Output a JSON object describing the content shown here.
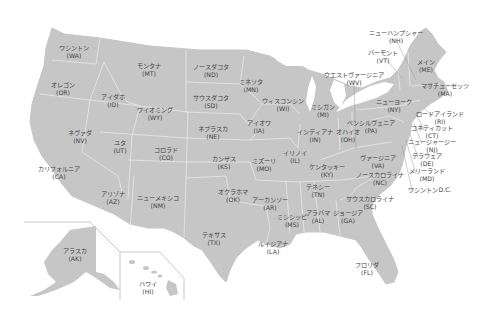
{
  "map": {
    "fill": "#c6c6c6",
    "border": "#ffffff",
    "leader_color": "#9a9a9a",
    "text_color": "#444444",
    "states": [
      {
        "name": "ワシントン",
        "abbr": "(WA)",
        "x": 74,
        "y": 44
      },
      {
        "name": "オレゴン",
        "abbr": "(OR)",
        "x": 63,
        "y": 81
      },
      {
        "name": "カリフォルニア",
        "abbr": "(CA)",
        "x": 59,
        "y": 165
      },
      {
        "name": "ネヴァダ",
        "abbr": "(NV)",
        "x": 80,
        "y": 129
      },
      {
        "name": "アイダホ",
        "abbr": "(ID)",
        "x": 113,
        "y": 93
      },
      {
        "name": "モンタナ",
        "abbr": "(MT)",
        "x": 149,
        "y": 62
      },
      {
        "name": "ワイオミング",
        "abbr": "(WY)",
        "x": 155,
        "y": 106
      },
      {
        "name": "ユタ",
        "abbr": "(UT)",
        "x": 120,
        "y": 139
      },
      {
        "name": "コロラド",
        "abbr": "(CO)",
        "x": 166,
        "y": 146
      },
      {
        "name": "アリゾナ",
        "abbr": "(AZ)",
        "x": 113,
        "y": 190
      },
      {
        "name": "ニューメキシコ",
        "abbr": "(NM)",
        "x": 158,
        "y": 194
      },
      {
        "name": "ノースダコタ",
        "abbr": "(ND)",
        "x": 211,
        "y": 63
      },
      {
        "name": "サウスダコタ",
        "abbr": "(SD)",
        "x": 211,
        "y": 94
      },
      {
        "name": "ネブラスカ",
        "abbr": "(NE)",
        "x": 213,
        "y": 125
      },
      {
        "name": "カンザス",
        "abbr": "(KS)",
        "x": 224,
        "y": 155
      },
      {
        "name": "オクラホマ",
        "abbr": "(OK)",
        "x": 233,
        "y": 188
      },
      {
        "name": "テキサス",
        "abbr": "(TX)",
        "x": 214,
        "y": 231
      },
      {
        "name": "ミネソタ",
        "abbr": "(MN)",
        "x": 251,
        "y": 78
      },
      {
        "name": "アイオワ",
        "abbr": "(IA)",
        "x": 259,
        "y": 119
      },
      {
        "name": "ミズーリ",
        "abbr": "(MO)",
        "x": 264,
        "y": 157
      },
      {
        "name": "アーカンソー",
        "abbr": "(AR)",
        "x": 270,
        "y": 196
      },
      {
        "name": "ルイジアナ",
        "abbr": "(LA)",
        "x": 273,
        "y": 240
      },
      {
        "name": "ウィスコンシン",
        "abbr": "(WI)",
        "x": 283,
        "y": 97
      },
      {
        "name": "イリノイ",
        "abbr": "(IL)",
        "x": 295,
        "y": 149
      },
      {
        "name": "ミシシッピ",
        "abbr": "(MS)",
        "x": 292,
        "y": 213
      },
      {
        "name": "ミシガン",
        "abbr": "(MI)",
        "x": 323,
        "y": 103
      },
      {
        "name": "インディアナ",
        "abbr": "(IN)",
        "x": 315,
        "y": 128
      },
      {
        "name": "ケンタッキー",
        "abbr": "(KY)",
        "x": 327,
        "y": 163
      },
      {
        "name": "テネシー",
        "abbr": "(TN)",
        "x": 318,
        "y": 183
      },
      {
        "name": "アラバマ",
        "abbr": "(AL)",
        "x": 318,
        "y": 209
      },
      {
        "name": "ジョージア",
        "abbr": "(GA)",
        "x": 348,
        "y": 209
      },
      {
        "name": "フロリダ",
        "abbr": "(FL)",
        "x": 367,
        "y": 261
      },
      {
        "name": "オハイオ",
        "abbr": "(OH)",
        "x": 348,
        "y": 128
      },
      {
        "name": "ペンシルヴェニア",
        "abbr": "(PA)",
        "x": 371,
        "y": 119
      },
      {
        "name": "ウエストヴァージニア",
        "abbr": "(WV)",
        "x": 354,
        "y": 71
      },
      {
        "name": "ヴァージニア",
        "abbr": "(VA)",
        "x": 378,
        "y": 154
      },
      {
        "name": "ノースカロライナ",
        "abbr": "(NC)",
        "x": 380,
        "y": 171
      },
      {
        "name": "サウスカロライナ",
        "abbr": "(SC)",
        "x": 370,
        "y": 195
      },
      {
        "name": "ニューヨーク",
        "abbr": "(NY)",
        "x": 394,
        "y": 98
      },
      {
        "name": "バーモント",
        "abbr": "(VT)",
        "x": 383,
        "y": 49
      },
      {
        "name": "ニューハンプシャー",
        "abbr": "(NH)",
        "x": 396,
        "y": 29
      },
      {
        "name": "メイン",
        "abbr": "(ME)",
        "x": 426,
        "y": 58
      },
      {
        "name": "マサチューセッツ",
        "abbr": "(MA)",
        "x": 445,
        "y": 82
      },
      {
        "name": "ロードアイランド",
        "abbr": "(RI)",
        "x": 440,
        "y": 110
      },
      {
        "name": "コネティカット",
        "abbr": "(CT)",
        "x": 432,
        "y": 124
      },
      {
        "name": "ニュージャージー",
        "abbr": "(NJ)",
        "x": 432,
        "y": 138
      },
      {
        "name": "デラウェア",
        "abbr": "(DE)",
        "x": 427,
        "y": 152
      },
      {
        "name": "メリーランド",
        "abbr": "(MD)",
        "x": 427,
        "y": 167
      },
      {
        "name": "ワシントンD.C.",
        "abbr": "",
        "x": 430,
        "y": 186
      },
      {
        "name": "アラスカ",
        "abbr": "(AK)",
        "x": 75,
        "y": 247
      },
      {
        "name": "ハワイ",
        "abbr": "(HI)",
        "x": 148,
        "y": 280
      }
    ]
  }
}
